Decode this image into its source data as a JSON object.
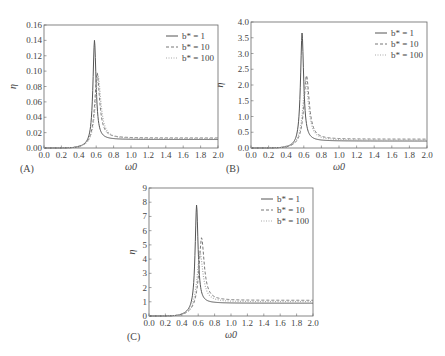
{
  "chart_data": [
    {
      "type": "line",
      "panel_label": "(A)",
      "xlabel": "ω0",
      "ylabel": "η",
      "xlim": [
        0.0,
        2.0
      ],
      "ylim": [
        0.0,
        0.16
      ],
      "xticks": [
        "0.0",
        "0.2",
        "0.4",
        "0.6",
        "0.8",
        "1.0",
        "1.2",
        "1.4",
        "1.6",
        "1.8",
        "2.0"
      ],
      "yticks": [
        "0.00",
        "0.02",
        "0.04",
        "0.06",
        "0.08",
        "0.10",
        "0.12",
        "0.14",
        "0.16"
      ],
      "grid": false,
      "legend_position": "upper right",
      "series": [
        {
          "name": "b* = 1",
          "style": "solid",
          "peak_x": 0.58,
          "peak_y": 0.14,
          "tail_y": 0.011,
          "width": 0.022
        },
        {
          "name": "b* = 10",
          "style": "dashed",
          "peak_x": 0.61,
          "peak_y": 0.098,
          "tail_y": 0.013,
          "width": 0.035
        },
        {
          "name": "b* = 100",
          "style": "dotted",
          "peak_x": 0.62,
          "peak_y": 0.094,
          "tail_y": 0.012,
          "width": 0.04
        }
      ]
    },
    {
      "type": "line",
      "panel_label": "(B)",
      "xlabel": "ω0",
      "ylabel": "η",
      "xlim": [
        0.0,
        2.0
      ],
      "ylim": [
        0.0,
        4.0
      ],
      "xticks": [
        "0.0",
        "0.2",
        "0.4",
        "0.6",
        "0.8",
        "1.0",
        "1.2",
        "1.4",
        "1.6",
        "1.8",
        "2.0"
      ],
      "yticks": [
        "0.0",
        "0.5",
        "1.0",
        "1.5",
        "2.0",
        "2.5",
        "3.0",
        "3.5",
        "4.0"
      ],
      "grid": false,
      "legend_position": "upper right",
      "series": [
        {
          "name": "b* = 1",
          "style": "solid",
          "peak_x": 0.58,
          "peak_y": 3.65,
          "tail_y": 0.22,
          "width": 0.022
        },
        {
          "name": "b* = 10",
          "style": "dashed",
          "peak_x": 0.63,
          "peak_y": 2.3,
          "tail_y": 0.28,
          "width": 0.038
        },
        {
          "name": "b* = 100",
          "style": "dotted",
          "peak_x": 0.62,
          "peak_y": 2.2,
          "tail_y": 0.25,
          "width": 0.04
        }
      ]
    },
    {
      "type": "line",
      "panel_label": "(C)",
      "xlabel": "ω0",
      "ylabel": "η",
      "xlim": [
        0.0,
        2.0
      ],
      "ylim": [
        0,
        9
      ],
      "xticks": [
        "0.0",
        "0.2",
        "0.4",
        "0.6",
        "0.8",
        "1.0",
        "1.2",
        "1.4",
        "1.6",
        "1.8",
        "2.0"
      ],
      "yticks": [
        "0",
        "1",
        "2",
        "3",
        "4",
        "5",
        "6",
        "7",
        "8",
        "9"
      ],
      "grid": false,
      "legend_position": "upper right",
      "series": [
        {
          "name": "b* = 1",
          "style": "solid",
          "peak_x": 0.58,
          "peak_y": 7.8,
          "tail_y": 0.9,
          "width": 0.022
        },
        {
          "name": "b* = 10",
          "style": "dashed",
          "peak_x": 0.64,
          "peak_y": 5.5,
          "tail_y": 1.1,
          "width": 0.04
        },
        {
          "name": "b* = 100",
          "style": "dotted",
          "peak_x": 0.62,
          "peak_y": 4.5,
          "tail_y": 1.0,
          "width": 0.045
        }
      ]
    }
  ],
  "layout": {
    "panels": [
      {
        "left": 44,
        "top": 25,
        "right": 218,
        "bottom": 148
      },
      {
        "left": 251,
        "top": 22,
        "right": 427,
        "bottom": 148
      },
      {
        "left": 149,
        "top": 188,
        "right": 313,
        "bottom": 316
      }
    ]
  },
  "colors": {
    "solid": "#555555",
    "dashed": "#666666",
    "dotted": "#aaaaaa",
    "axis": "#666666"
  }
}
